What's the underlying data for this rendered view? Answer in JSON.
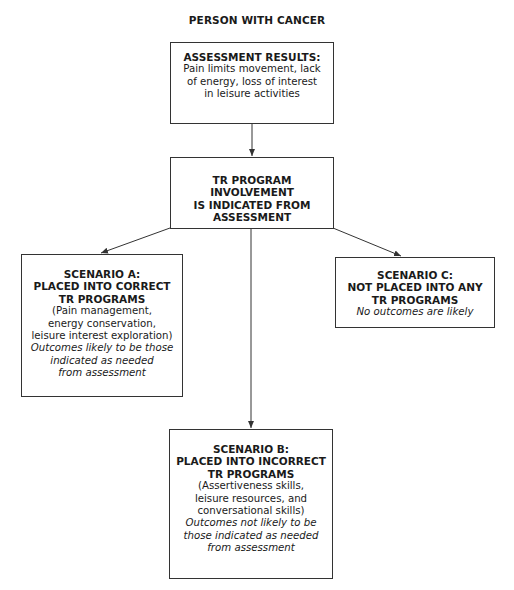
{
  "diagram": {
    "title": "PERSON WITH CANCER",
    "nodes": {
      "assessment": {
        "heading": [
          "ASSESSMENT RESULTS:"
        ],
        "body": [
          "Pain limits movement, lack",
          "of energy, loss of interest",
          "in leisure activities"
        ],
        "note": []
      },
      "involvement": {
        "heading": [
          "TR PROGRAM INVOLVEMENT",
          "IS INDICATED FROM",
          "ASSESSMENT"
        ],
        "body": [],
        "note": []
      },
      "scenario_a": {
        "heading": [
          "SCENARIO A:",
          "PLACED INTO CORRECT",
          "TR PROGRAMS"
        ],
        "body": [
          "(Pain management,",
          "energy conservation,",
          "leisure interest exploration)"
        ],
        "note": [
          "Outcomes likely to be those",
          "indicated as needed",
          "from assessment"
        ]
      },
      "scenario_c": {
        "heading": [
          "SCENARIO C:",
          "NOT PLACED INTO ANY",
          "TR PROGRAMS"
        ],
        "body": [],
        "note": [
          "No outcomes are likely"
        ]
      },
      "scenario_b": {
        "heading": [
          "SCENARIO B:",
          "PLACED INTO INCORRECT",
          "TR PROGRAMS"
        ],
        "body": [
          "(Assertiveness skills,",
          "leisure resources, and",
          "conversational skills)"
        ],
        "note": [
          "Outcomes not likely to be",
          "those indicated as needed",
          "from assessment"
        ]
      }
    },
    "edges": [
      {
        "from": "assessment",
        "to": "involvement"
      },
      {
        "from": "involvement",
        "to": "scenario_a"
      },
      {
        "from": "involvement",
        "to": "scenario_b"
      },
      {
        "from": "involvement",
        "to": "scenario_c"
      }
    ],
    "colors": {
      "line": "#333333",
      "text": "#1a1a1a",
      "background": "#ffffff"
    }
  }
}
